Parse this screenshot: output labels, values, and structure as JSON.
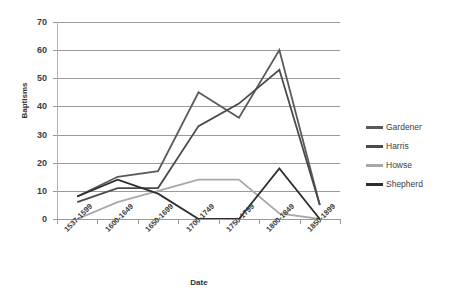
{
  "chart_data": {
    "type": "line",
    "title": "",
    "xlabel": "Date",
    "ylabel": "Baptisms",
    "ylim": [
      0,
      70
    ],
    "ytick_step": 10,
    "yticks": [
      0,
      10,
      20,
      30,
      40,
      50,
      60,
      70
    ],
    "grid": true,
    "legend_position": "right",
    "categories": [
      "1537-1599",
      "1600-1649",
      "1650-1699",
      "1700-1749",
      "1750-1799",
      "1800-1849",
      "1850-1899"
    ],
    "series": [
      {
        "name": "Gardener",
        "color": "#5a5a5a",
        "values": [
          8,
          15,
          17,
          45,
          36,
          60,
          5
        ]
      },
      {
        "name": "Harris",
        "color": "#4a4a4a",
        "values": [
          6,
          11,
          11,
          33,
          41,
          53,
          5
        ]
      },
      {
        "name": "Howse",
        "color": "#a8a8a8",
        "values": [
          0,
          6,
          10,
          14,
          14,
          2,
          0
        ]
      },
      {
        "name": "Shepherd",
        "color": "#2e2e2e",
        "values": [
          8,
          14,
          9,
          0,
          0,
          18,
          0
        ]
      }
    ]
  },
  "axes": {
    "y_title": "Baptisms",
    "x_title": "Date",
    "y_labels": [
      "70",
      "60",
      "50",
      "40",
      "30",
      "20",
      "10",
      "0"
    ],
    "x_labels": [
      "1537-1599",
      "1600-1649",
      "1650-1699",
      "1700-1749",
      "1750-1799",
      "1800-1849",
      "1850-1899"
    ]
  },
  "legend": {
    "items": [
      {
        "label": "Gardener",
        "color": "#5a5a5a"
      },
      {
        "label": "Harris",
        "color": "#4a4a4a"
      },
      {
        "label": "Howse",
        "color": "#a8a8a8"
      },
      {
        "label": "Shepherd",
        "color": "#2e2e2e"
      }
    ]
  },
  "colors": {
    "background": "#ffffff",
    "gridline": "#9a9a9a",
    "axis": "#b0b0b0",
    "text": "#3d3d3d"
  }
}
